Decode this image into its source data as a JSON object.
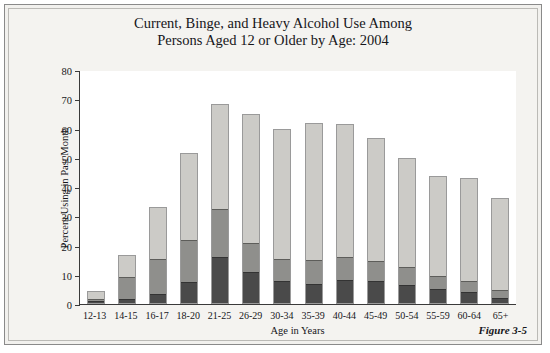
{
  "figure": {
    "title_line1": "Current, Binge, and Heavy Alcohol Use Among",
    "title_line2": "Persons Aged 12 or Older by Age: 2004",
    "caption": "Figure 3-5"
  },
  "colors": {
    "current_use": "#cccbc7",
    "binge_use": "#8f8f8c",
    "heavy_use": "#4a4a4a",
    "axis": "#3a3a3a",
    "plot_background": "#ffffff",
    "page_background": "#f4f3f0"
  },
  "chart_data": {
    "type": "bar",
    "stacked": true,
    "title": "Current, Binge, and Heavy Alcohol Use Among Persons Aged 12 or Older by Age: 2004",
    "xlabel": "Age in Years",
    "ylabel": "Percent Using in Past Month",
    "ylim": [
      0,
      80
    ],
    "yticks": [
      0,
      10,
      20,
      30,
      40,
      50,
      60,
      70,
      80
    ],
    "grid": false,
    "legend_position": "top-right",
    "categories": [
      "12-13",
      "14-15",
      "16-17",
      "18-20",
      "21-25",
      "26-29",
      "30-34",
      "35-39",
      "40-44",
      "45-49",
      "50-54",
      "55-59",
      "60-64",
      "65+"
    ],
    "series": [
      {
        "name": "Heavy Alcohol Use",
        "color": "#4a4a4a",
        "values": [
          0.6,
          1.4,
          3.2,
          7.2,
          16.0,
          10.8,
          7.5,
          6.7,
          8.0,
          7.6,
          6.3,
          5.0,
          3.8,
          1.8
        ]
      },
      {
        "name": "Binge Use (Not Heavy)",
        "color": "#8f8f8c",
        "values": [
          1.0,
          7.9,
          12.2,
          14.5,
          16.6,
          9.9,
          7.8,
          8.2,
          7.8,
          7.0,
          6.3,
          4.5,
          3.9,
          2.6
        ]
      },
      {
        "name": "Current Use (Not Binge)",
        "color": "#cccbc7",
        "values": [
          2.7,
          7.5,
          17.6,
          30.1,
          35.9,
          44.2,
          44.5,
          47.0,
          45.6,
          42.3,
          37.2,
          34.3,
          35.3,
          31.9
        ]
      }
    ],
    "cumulative_totals": [
      4.3,
      16.8,
      33.0,
      51.8,
      68.5,
      64.9,
      59.8,
      61.9,
      61.4,
      56.9,
      49.8,
      43.8,
      43.0,
      36.3
    ],
    "legend": [
      "Current Use (Not Binge)",
      "Binge Use (Not Heavy)",
      "Heavy Alcohol Use"
    ]
  }
}
